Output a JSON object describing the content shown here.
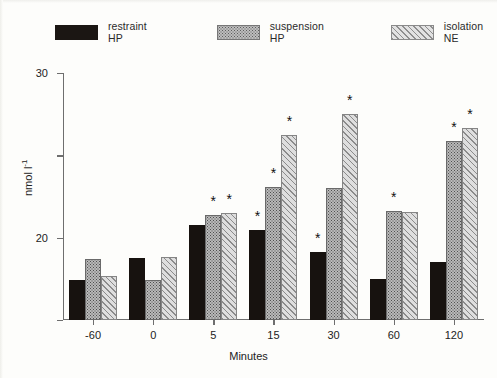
{
  "chart_data": {
    "type": "bar",
    "title": "",
    "xlabel": "Minutes",
    "ylabel": "nmol l⁻¹",
    "ylabel_base": "nmol l",
    "ylabel_exp": "-1",
    "categories": [
      "-60",
      "0",
      "5",
      "15",
      "30",
      "60",
      "120"
    ],
    "ylim": [
      0,
      30
    ],
    "yticks": [
      "0",
      "10",
      "20",
      "30"
    ],
    "grid": false,
    "legend_position": "top",
    "series": [
      {
        "name": "restraint HP",
        "pattern": "solid-black",
        "color": "#17120f",
        "values": [
          4.9,
          7.5,
          11.6,
          10.9,
          8.3,
          5.0,
          7.1
        ],
        "significance": [
          false,
          false,
          false,
          true,
          true,
          false,
          false
        ]
      },
      {
        "name": "suspension HP",
        "pattern": "stipple",
        "color": "#b9b9b9",
        "values": [
          7.4,
          4.9,
          12.8,
          16.2,
          16.0,
          13.3,
          21.7
        ],
        "significance": [
          false,
          false,
          true,
          true,
          false,
          true,
          true
        ]
      },
      {
        "name": "isolation NE",
        "pattern": "diagonal-hatch",
        "color": "#dedede",
        "values": [
          5.3,
          7.6,
          13.0,
          22.5,
          25.0,
          13.1,
          23.3
        ],
        "significance": [
          false,
          false,
          true,
          true,
          true,
          false,
          true
        ]
      }
    ],
    "significance_marker": "*",
    "significance_note": "asterisks mark values significantly different from baseline"
  }
}
